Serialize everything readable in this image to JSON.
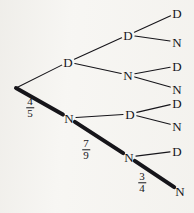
{
  "figure": {
    "type": "probability-tree-diagram",
    "width": 194,
    "height": 213,
    "background_color": "#f7f6f3",
    "ink_color": "#16151a"
  },
  "chart_data": {
    "type": "tree",
    "title": "",
    "outcome_labels": [
      "D",
      "N"
    ],
    "nodes": [
      {
        "id": "root",
        "label": "",
        "x": 16,
        "y": 88,
        "level": 0
      },
      {
        "id": "d1",
        "label": "D",
        "x": 68,
        "y": 62,
        "level": 1
      },
      {
        "id": "n1",
        "label": "N",
        "x": 69,
        "y": 118,
        "level": 1
      },
      {
        "id": "d1d2",
        "label": "D",
        "x": 128,
        "y": 35,
        "level": 2
      },
      {
        "id": "d1n2",
        "label": "N",
        "x": 128,
        "y": 75,
        "level": 2
      },
      {
        "id": "n1d2",
        "label": "D",
        "x": 130,
        "y": 114,
        "level": 2
      },
      {
        "id": "n1n2",
        "label": "N",
        "x": 129,
        "y": 157,
        "level": 2
      },
      {
        "id": "leaf1",
        "label": "D",
        "x": 177,
        "y": 13,
        "level": 3
      },
      {
        "id": "leaf2",
        "label": "N",
        "x": 177,
        "y": 42,
        "level": 3
      },
      {
        "id": "leaf3",
        "label": "D",
        "x": 177,
        "y": 66,
        "level": 3
      },
      {
        "id": "leaf4",
        "label": "N",
        "x": 177,
        "y": 89,
        "level": 3
      },
      {
        "id": "leaf5",
        "label": "D",
        "x": 177,
        "y": 103,
        "level": 3
      },
      {
        "id": "leaf6",
        "label": "N",
        "x": 177,
        "y": 126,
        "level": 3
      },
      {
        "id": "leaf7",
        "label": "D",
        "x": 177,
        "y": 151,
        "level": 3
      },
      {
        "id": "leaf8",
        "label": "N",
        "x": 180,
        "y": 191,
        "level": 3
      }
    ],
    "edges": [
      {
        "from": "root",
        "to": "d1",
        "weight": "thin",
        "label": ""
      },
      {
        "from": "root",
        "to": "n1",
        "weight": "thick",
        "label": "4/5"
      },
      {
        "from": "d1",
        "to": "d1d2",
        "weight": "thin",
        "label": ""
      },
      {
        "from": "d1",
        "to": "d1n2",
        "weight": "thin",
        "label": ""
      },
      {
        "from": "n1",
        "to": "n1d2",
        "weight": "thin",
        "label": ""
      },
      {
        "from": "n1",
        "to": "n1n2",
        "weight": "thick",
        "label": "7/9"
      },
      {
        "from": "d1d2",
        "to": "leaf1",
        "weight": "thin",
        "label": ""
      },
      {
        "from": "d1d2",
        "to": "leaf2",
        "weight": "thin",
        "label": ""
      },
      {
        "from": "d1n2",
        "to": "leaf3",
        "weight": "thin",
        "label": ""
      },
      {
        "from": "d1n2",
        "to": "leaf4",
        "weight": "thin",
        "label": ""
      },
      {
        "from": "n1d2",
        "to": "leaf5",
        "weight": "thin",
        "label": ""
      },
      {
        "from": "n1d2",
        "to": "leaf6",
        "weight": "thin",
        "label": ""
      },
      {
        "from": "n1n2",
        "to": "leaf7",
        "weight": "thin",
        "label": ""
      },
      {
        "from": "n1n2",
        "to": "leaf8",
        "weight": "thick",
        "label": "3/4"
      }
    ],
    "probabilities": [
      {
        "id": "p1",
        "numerator": "4",
        "denominator": "5",
        "x": 30,
        "y": 108,
        "edge": "root-n1"
      },
      {
        "id": "p2",
        "numerator": "7",
        "denominator": "9",
        "x": 86,
        "y": 150,
        "edge": "n1-n1n2"
      },
      {
        "id": "p3",
        "numerator": "3",
        "denominator": "4",
        "x": 142,
        "y": 183,
        "edge": "n1n2-leaf8"
      }
    ],
    "highlighted_path": [
      "root",
      "n1",
      "n1n2",
      "leaf8"
    ],
    "highlighted_probabilities": [
      "4/5",
      "7/9",
      "3/4"
    ]
  }
}
